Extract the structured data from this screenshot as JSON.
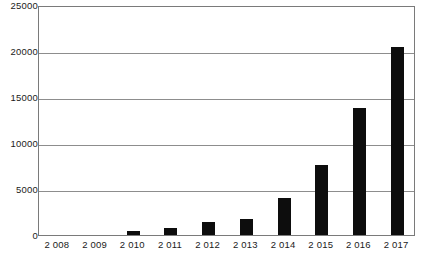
{
  "chart_data": {
    "type": "bar",
    "title": "",
    "subtitle": "",
    "xlabel": "",
    "ylabel": "",
    "categories": [
      "2 008",
      "2 009",
      "2 010",
      "2 011",
      "2 012",
      "2 013",
      "2 014",
      "2 015",
      "2 016",
      "2 017"
    ],
    "values": [
      0,
      0,
      400,
      800,
      1400,
      1750,
      4000,
      7650,
      13850,
      20400
    ],
    "series": [
      {
        "name": "",
        "values": [
          0,
          0,
          400,
          800,
          1400,
          1750,
          4000,
          7650,
          13850,
          20400
        ]
      }
    ],
    "ylim": [
      0,
      25000
    ],
    "ytick_labels": [
      "0",
      "5000",
      "10000",
      "15000",
      "20000",
      "25000"
    ],
    "ytick_values": [
      0,
      5000,
      10000,
      15000,
      20000,
      25000
    ],
    "grid": true,
    "grid_axis": "y",
    "legend": false,
    "legend_position": "none",
    "bar_color": "#0d0d0d",
    "grid_color": "#8d8d8d",
    "frame_color": "#7a7a7a",
    "background_color": "#ffffff"
  }
}
